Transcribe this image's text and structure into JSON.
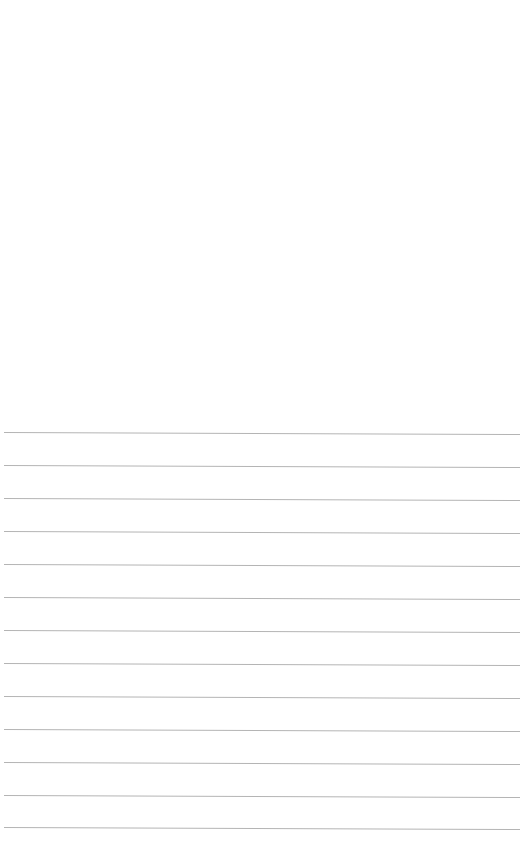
{
  "page": {
    "type": "lined-paper",
    "background_color": "#ffffff",
    "rule_color": "#b4b4b4",
    "rule_count": 13,
    "rule_spacing_px": 33,
    "first_rule_y_px": 432,
    "rule_left_px": 4,
    "rule_width_px": 516,
    "rules": [
      {
        "y": 432
      },
      {
        "y": 465
      },
      {
        "y": 498
      },
      {
        "y": 531
      },
      {
        "y": 564
      },
      {
        "y": 597
      },
      {
        "y": 630
      },
      {
        "y": 663
      },
      {
        "y": 696
      },
      {
        "y": 729
      },
      {
        "y": 762
      },
      {
        "y": 795
      },
      {
        "y": 827
      }
    ]
  }
}
